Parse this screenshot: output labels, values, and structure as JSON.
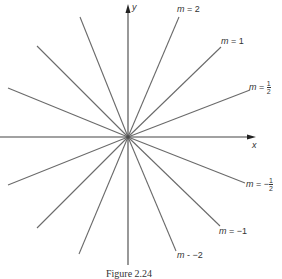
{
  "figure": {
    "axes": {
      "x_label": "x",
      "y_label": "y"
    },
    "lines": [
      {
        "slope": "2",
        "label": "m = 2"
      },
      {
        "slope": "1",
        "label": "m = 1"
      },
      {
        "slope": "1/2",
        "label": "m = 1/2"
      },
      {
        "slope": "-1/2",
        "label": "m = -1/2"
      },
      {
        "slope": "-1",
        "label": "m = -1"
      },
      {
        "slope": "-2",
        "label": "m = -2"
      }
    ],
    "labels": {
      "m2": {
        "prefix": "m",
        "eq": " = 2"
      },
      "m1": {
        "prefix": "m",
        "eq": " = 1"
      },
      "mhalf": {
        "prefix": "m",
        "eq": " = ",
        "num": "1",
        "den": "2"
      },
      "mneghalf": {
        "prefix": "m",
        "eq": " = −",
        "num": "1",
        "den": "2"
      },
      "mneg1": {
        "prefix": "m",
        "eq": " = −1"
      },
      "mneg2": {
        "prefix": "m",
        "eq": " - −2"
      }
    },
    "caption": "Figure 2.24",
    "line_color": "#666666"
  }
}
